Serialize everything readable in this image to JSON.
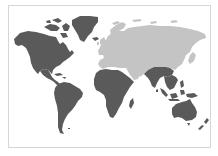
{
  "map": {
    "type": "world-map",
    "projection": "equirectangular",
    "colors": {
      "background": "#ffffff",
      "frame_border": "#d6d6d6",
      "highlighted": "#5a5a5a",
      "other": "#c4c4c4"
    },
    "regions": [
      {
        "name": "North America",
        "group": "highlighted"
      },
      {
        "name": "Greenland",
        "group": "highlighted"
      },
      {
        "name": "Central America & Caribbean",
        "group": "highlighted"
      },
      {
        "name": "South America",
        "group": "highlighted"
      },
      {
        "name": "Sub-Saharan Africa",
        "group": "highlighted"
      },
      {
        "name": "Madagascar",
        "group": "highlighted"
      },
      {
        "name": "South Asia",
        "group": "highlighted"
      },
      {
        "name": "Southeast Asia",
        "group": "highlighted"
      },
      {
        "name": "Maritime Southeast Asia",
        "group": "highlighted"
      },
      {
        "name": "Australia",
        "group": "highlighted"
      },
      {
        "name": "New Zealand",
        "group": "highlighted"
      },
      {
        "name": "Europe",
        "group": "other"
      },
      {
        "name": "Russia & Northern Asia",
        "group": "other"
      },
      {
        "name": "Middle East",
        "group": "other"
      },
      {
        "name": "North Africa",
        "group": "other"
      },
      {
        "name": "China & East Asia",
        "group": "other"
      },
      {
        "name": "Japan",
        "group": "other"
      }
    ]
  }
}
